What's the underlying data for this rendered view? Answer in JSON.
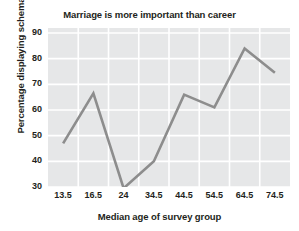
{
  "chart_data": {
    "type": "line",
    "title": "Marriage is more important than career",
    "xlabel": "Median age of survey group",
    "ylabel": "Percentage displaying schema",
    "categories": [
      "13.5",
      "16.5",
      "24",
      "34.5",
      "44.5",
      "54.5",
      "64.5",
      "74.5"
    ],
    "x": [
      13.5,
      16.5,
      24,
      34.5,
      44.5,
      54.5,
      64.5,
      74.5
    ],
    "values": [
      47,
      66.5,
      29.5,
      40,
      66,
      61,
      84,
      74.5
    ],
    "series": [
      {
        "name": "Percentage displaying schema",
        "values": [
          47,
          66.5,
          29.5,
          40,
          66,
          61,
          84,
          74.5
        ]
      }
    ],
    "yticks": [
      30,
      40,
      50,
      60,
      70,
      80,
      90
    ],
    "ylim": [
      30,
      90
    ],
    "grid": true,
    "legend": "none",
    "line_color": "#8d8d8d",
    "plot_background": "#e6e7e8",
    "gridline_color": "#ffffff",
    "text_color": "#231f20"
  }
}
